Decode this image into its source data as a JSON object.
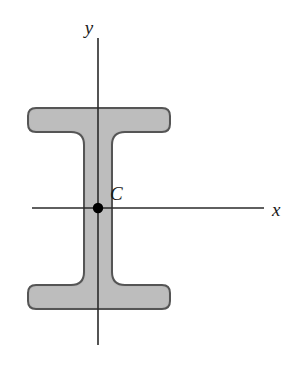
{
  "figure": {
    "background_color": "#ffffff",
    "width": 305,
    "height": 372
  },
  "labels": {
    "y_axis": "y",
    "x_axis": "x",
    "centroid": "C"
  },
  "colors": {
    "section_fill": "#b9b9b9",
    "section_stroke": "#555555",
    "axis_line": "#2a2a2a",
    "centroid_marker": "#000000",
    "label_text": "#1a1a1a"
  },
  "geometry": {
    "axes": {
      "y_axis": {
        "x": 98,
        "y_top": 38,
        "y_bottom": 345
      },
      "x_axis": {
        "y": 208,
        "x_left": 32,
        "x_right": 264
      }
    },
    "centroid_point": {
      "x": 98,
      "y": 208,
      "radius": 5
    },
    "section": {
      "flange_left": 28,
      "flange_right": 170,
      "top_flange_top": 108,
      "top_flange_bottom": 132,
      "bottom_flange_top": 285,
      "bottom_flange_bottom": 309,
      "web_left": 84,
      "web_right": 112,
      "outer_corner_radius": 8,
      "fillet_radius": 13
    },
    "label_positions": {
      "y": {
        "x": 89,
        "y": 34
      },
      "x": {
        "x": 272,
        "y": 216
      },
      "C": {
        "x": 110,
        "y": 200
      }
    }
  }
}
